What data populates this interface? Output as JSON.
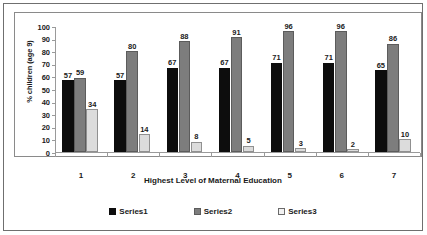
{
  "chart_data": {
    "type": "bar",
    "title": "",
    "xlabel": "Highest Level of Maternal Education",
    "ylabel": "% children (age 9)",
    "categories": [
      "1",
      "2",
      "3",
      "4",
      "5",
      "6",
      "7"
    ],
    "series": [
      {
        "name": "Series1",
        "color": "#0d0d0d",
        "values": [
          57,
          57,
          67,
          67,
          71,
          71,
          65
        ]
      },
      {
        "name": "Series2",
        "color": "#7d7d7d",
        "values": [
          59,
          80,
          88,
          91,
          96,
          96,
          86
        ]
      },
      {
        "name": "Series3",
        "color": "#dcdcdc",
        "values": [
          34,
          14,
          8,
          5,
          3,
          2,
          10
        ]
      }
    ],
    "ylim": [
      0,
      100
    ],
    "yticks": [
      0,
      10,
      20,
      30,
      40,
      50,
      60,
      70,
      80,
      90,
      100
    ],
    "ytick_labels": [
      "0",
      "10",
      "20",
      "30",
      "40",
      "50",
      "60",
      "70",
      "80",
      "90",
      "100"
    ],
    "grid": false,
    "data_labels": true,
    "legend_position": "bottom"
  },
  "legend": {
    "items": [
      {
        "label": "Series1"
      },
      {
        "label": "Series2"
      },
      {
        "label": "Series3"
      }
    ]
  }
}
